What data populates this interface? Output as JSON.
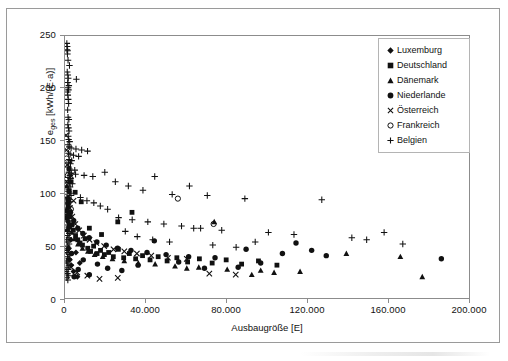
{
  "figure": {
    "background_color": "#ffffff",
    "frame_color": "#9a9a9a",
    "marker_color": "#111111"
  },
  "axes": {
    "x_title": "Ausbaugröße [E]",
    "y_title_main": "e",
    "y_title_sub": "ges",
    "y_title_unit": " [kWh/(E·a)]",
    "x_ticks": [
      "0",
      "40.000",
      "80.000",
      "120.000",
      "160.000",
      "200.000"
    ],
    "y_ticks": [
      "0",
      "50",
      "100",
      "150",
      "200",
      "250"
    ]
  },
  "legend": {
    "items": [
      {
        "label": "Luxemburg",
        "marker": "diamond-marker",
        "glyph": "♦"
      },
      {
        "label": "Deutschland",
        "marker": "square-marker",
        "glyph": "■"
      },
      {
        "label": "Dänemark",
        "marker": "triangle-marker",
        "glyph": "▲"
      },
      {
        "label": "Niederlande",
        "marker": "circle-filled-marker",
        "glyph": "●"
      },
      {
        "label": "Österreich",
        "marker": "cross-x-marker",
        "glyph": "✕"
      },
      {
        "label": "Frankreich",
        "marker": "circle-open-marker",
        "glyph": "○"
      },
      {
        "label": "Belgien",
        "marker": "plus-marker",
        "glyph": "+"
      }
    ]
  },
  "chart_data": {
    "type": "scatter",
    "title": "",
    "xlabel": "Ausbaugröße [E]",
    "ylabel": "e_ges [kWh/(E·a)]",
    "xlim": [
      0,
      200000
    ],
    "ylim": [
      0,
      250
    ],
    "xticks": [
      0,
      40000,
      80000,
      120000,
      160000,
      200000
    ],
    "yticks": [
      0,
      50,
      100,
      150,
      200,
      250
    ],
    "grid": false,
    "legend_position": "top-right",
    "series": [
      {
        "name": "Luxemburg",
        "marker": "diamond",
        "points": [
          [
            1200,
            66
          ],
          [
            1800,
            49
          ],
          [
            2400,
            38
          ],
          [
            3100,
            33
          ],
          [
            4200,
            27
          ],
          [
            5400,
            45
          ],
          [
            6100,
            22
          ],
          [
            7300,
            35
          ],
          [
            2900,
            57
          ],
          [
            1500,
            74
          ]
        ]
      },
      {
        "name": "Deutschland",
        "marker": "square",
        "points": [
          [
            1500,
            88
          ],
          [
            2600,
            79
          ],
          [
            3400,
            71
          ],
          [
            4100,
            66
          ],
          [
            5200,
            61
          ],
          [
            6300,
            57
          ],
          [
            7400,
            54
          ],
          [
            8600,
            52
          ],
          [
            9900,
            58
          ],
          [
            11200,
            49
          ],
          [
            12600,
            46
          ],
          [
            14100,
            51
          ],
          [
            15800,
            44
          ],
          [
            17500,
            47
          ],
          [
            19400,
            43
          ],
          [
            21500,
            45
          ],
          [
            23800,
            41
          ],
          [
            26300,
            48
          ],
          [
            28900,
            40
          ],
          [
            31700,
            44
          ],
          [
            34800,
            39
          ],
          [
            38200,
            42
          ],
          [
            41900,
            38
          ],
          [
            45900,
            41
          ],
          [
            50300,
            37
          ],
          [
            55100,
            40
          ],
          [
            60400,
            36
          ],
          [
            66200,
            39
          ],
          [
            72500,
            35
          ],
          [
            79400,
            38
          ],
          [
            87000,
            34
          ],
          [
            95300,
            37
          ],
          [
            104400,
            33
          ],
          [
            33000,
            83
          ],
          [
            26000,
            74
          ],
          [
            18000,
            62
          ],
          [
            12000,
            68
          ],
          [
            8000,
            93
          ],
          [
            5000,
            102
          ],
          [
            3000,
            112
          ],
          [
            2000,
            124
          ],
          [
            1400,
            96
          ],
          [
            900,
            84
          ],
          [
            600,
            78
          ],
          [
            2200,
            69
          ]
        ]
      },
      {
        "name": "Dänemark",
        "marker": "triangle",
        "points": [
          [
            1200,
            81
          ],
          [
            2100,
            72
          ],
          [
            3300,
            64
          ],
          [
            4700,
            58
          ],
          [
            6400,
            53
          ],
          [
            8600,
            49
          ],
          [
            11300,
            46
          ],
          [
            14600,
            43
          ],
          [
            18600,
            41
          ],
          [
            23400,
            39
          ],
          [
            29200,
            37
          ],
          [
            36100,
            35
          ],
          [
            44400,
            34
          ],
          [
            54200,
            32
          ],
          [
            65900,
            31
          ],
          [
            79900,
            29
          ],
          [
            96400,
            28
          ],
          [
            115800,
            27
          ],
          [
            138600,
            44
          ],
          [
            165200,
            41
          ],
          [
            176000,
            22
          ],
          [
            103000,
            26
          ],
          [
            92000,
            24
          ],
          [
            73500,
            74
          ],
          [
            60000,
            30
          ],
          [
            1800,
            95
          ],
          [
            900,
            108
          ]
        ]
      },
      {
        "name": "Niederlande",
        "marker": "circle-filled",
        "points": [
          [
            1400,
            92
          ],
          [
            2700,
            83
          ],
          [
            4300,
            75
          ],
          [
            6300,
            68
          ],
          [
            8800,
            63
          ],
          [
            11900,
            59
          ],
          [
            15700,
            55
          ],
          [
            20300,
            52
          ],
          [
            25900,
            49
          ],
          [
            32500,
            47
          ],
          [
            40400,
            45
          ],
          [
            49800,
            43
          ],
          [
            60900,
            41
          ],
          [
            73900,
            40
          ],
          [
            89200,
            48
          ],
          [
            107100,
            44
          ],
          [
            113800,
            54
          ],
          [
            121500,
            47
          ],
          [
            128700,
            42
          ],
          [
            185400,
            39
          ],
          [
            96400,
            35
          ],
          [
            85300,
            31
          ],
          [
            68700,
            30
          ],
          [
            56000,
            36
          ],
          [
            44000,
            56
          ],
          [
            36000,
            33
          ],
          [
            28000,
            28
          ],
          [
            21000,
            30
          ],
          [
            16000,
            34
          ],
          [
            12000,
            24
          ],
          [
            9000,
            38
          ],
          [
            6500,
            29
          ],
          [
            4500,
            22
          ],
          [
            3200,
            44
          ],
          [
            2000,
            103
          ]
        ]
      },
      {
        "name": "Österreich",
        "marker": "cross-x",
        "points": [
          [
            800,
            112
          ],
          [
            1500,
            98
          ],
          [
            2400,
            87
          ],
          [
            3600,
            79
          ],
          [
            5100,
            72
          ],
          [
            7000,
            66
          ],
          [
            9300,
            61
          ],
          [
            12100,
            57
          ],
          [
            15400,
            54
          ],
          [
            19300,
            51
          ],
          [
            23900,
            48
          ],
          [
            29200,
            46
          ],
          [
            35400,
            44
          ],
          [
            42500,
            42
          ],
          [
            50700,
            40
          ],
          [
            60000,
            39
          ],
          [
            71100,
            25
          ],
          [
            84100,
            24
          ],
          [
            26000,
            21
          ],
          [
            17000,
            20
          ],
          [
            11000,
            23
          ],
          [
            6000,
            26
          ],
          [
            3000,
            31
          ],
          [
            1600,
            46
          ],
          [
            700,
            142
          ],
          [
            500,
            156
          ],
          [
            1100,
            128
          ],
          [
            2800,
            118
          ],
          [
            4200,
            94
          ]
        ]
      },
      {
        "name": "Frankreich",
        "marker": "circle-open",
        "points": [
          [
            55600,
            96
          ],
          [
            73200,
            72
          ],
          [
            1400,
            118
          ],
          [
            2900,
            86
          ],
          [
            800,
            134
          ]
        ]
      },
      {
        "name": "Belgien",
        "marker": "plus",
        "points": [
          [
            900,
            243
          ],
          [
            1100,
            240
          ],
          [
            1000,
            237
          ],
          [
            1300,
            236
          ],
          [
            1200,
            233
          ],
          [
            1500,
            227
          ],
          [
            2200,
            222
          ],
          [
            1100,
            216
          ],
          [
            1400,
            213
          ],
          [
            1600,
            210
          ],
          [
            5600,
            209
          ],
          [
            1300,
            206
          ],
          [
            1900,
            203
          ],
          [
            1500,
            201
          ],
          [
            1700,
            199
          ],
          [
            1200,
            197
          ],
          [
            1400,
            194
          ],
          [
            1600,
            190
          ],
          [
            1800,
            186
          ],
          [
            1300,
            180
          ],
          [
            1500,
            173
          ],
          [
            1900,
            171
          ],
          [
            1400,
            166
          ],
          [
            1700,
            163
          ],
          [
            2000,
            160
          ],
          [
            1600,
            155
          ],
          [
            1800,
            152
          ],
          [
            2300,
            150
          ],
          [
            1500,
            147
          ],
          [
            2100,
            145
          ],
          [
            3000,
            144
          ],
          [
            5400,
            143
          ],
          [
            8200,
            142
          ],
          [
            11100,
            141
          ],
          [
            1700,
            139
          ],
          [
            2500,
            138
          ],
          [
            4200,
            137
          ],
          [
            6700,
            136
          ],
          [
            2000,
            133
          ],
          [
            3300,
            132
          ],
          [
            1800,
            130
          ],
          [
            2700,
            129
          ],
          [
            1600,
            126
          ],
          [
            2200,
            124
          ],
          [
            4800,
            123
          ],
          [
            1900,
            121
          ],
          [
            3100,
            120
          ],
          [
            2400,
            118
          ],
          [
            1500,
            116
          ],
          [
            2800,
            115
          ],
          [
            1700,
            113
          ],
          [
            2100,
            111
          ],
          [
            3600,
            110
          ],
          [
            1400,
            108
          ],
          [
            2500,
            107
          ],
          [
            1800,
            105
          ],
          [
            5200,
            119
          ],
          [
            9400,
            118
          ],
          [
            13700,
            117
          ],
          [
            19600,
            121
          ],
          [
            24800,
            112
          ],
          [
            31200,
            108
          ],
          [
            38400,
            104
          ],
          [
            44200,
            117
          ],
          [
            52800,
            100
          ],
          [
            61300,
            108
          ],
          [
            70100,
            99
          ],
          [
            1600,
            103
          ],
          [
            2300,
            101
          ],
          [
            3000,
            99
          ],
          [
            1300,
            97
          ],
          [
            1900,
            95
          ],
          [
            2600,
            93
          ],
          [
            1500,
            91
          ],
          [
            2100,
            89
          ],
          [
            1100,
            87
          ],
          [
            1700,
            85
          ],
          [
            2400,
            83
          ],
          [
            1400,
            81
          ],
          [
            2000,
            79
          ],
          [
            900,
            77
          ],
          [
            1600,
            75
          ],
          [
            2200,
            73
          ],
          [
            1200,
            71
          ],
          [
            1800,
            69
          ],
          [
            1000,
            67
          ],
          [
            1500,
            65
          ],
          [
            2100,
            63
          ],
          [
            1300,
            61
          ],
          [
            1900,
            59
          ],
          [
            800,
            57
          ],
          [
            1400,
            55
          ],
          [
            2000,
            53
          ],
          [
            1100,
            51
          ],
          [
            1700,
            49
          ],
          [
            900,
            47
          ],
          [
            1500,
            45
          ],
          [
            2100,
            43
          ],
          [
            1200,
            41
          ],
          [
            1800,
            39
          ],
          [
            700,
            37
          ],
          [
            1300,
            35
          ],
          [
            1900,
            33
          ],
          [
            1000,
            31
          ],
          [
            1600,
            29
          ],
          [
            600,
            27
          ],
          [
            1200,
            25
          ],
          [
            1800,
            23
          ],
          [
            900,
            21
          ],
          [
            1400,
            19
          ],
          [
            26400,
            78
          ],
          [
            33100,
            76
          ],
          [
            40800,
            74
          ],
          [
            48700,
            72
          ],
          [
            57400,
            70
          ],
          [
            66800,
            68
          ],
          [
            77200,
            66
          ],
          [
            88600,
            96
          ],
          [
            100200,
            64
          ],
          [
            112800,
            62
          ],
          [
            126500,
            95
          ],
          [
            141300,
            59
          ],
          [
            157200,
            64
          ],
          [
            148600,
            57
          ],
          [
            166400,
            53
          ],
          [
            21000,
            86
          ],
          [
            17400,
            89
          ],
          [
            14200,
            92
          ],
          [
            10800,
            94
          ],
          [
            7600,
            97
          ],
          [
            29700,
            65
          ],
          [
            35600,
            60
          ],
          [
            43200,
            57
          ],
          [
            51500,
            55
          ],
          [
            63400,
            68
          ],
          [
            72800,
            52
          ],
          [
            84300,
            50
          ],
          [
            93700,
            55
          ]
        ]
      }
    ]
  }
}
